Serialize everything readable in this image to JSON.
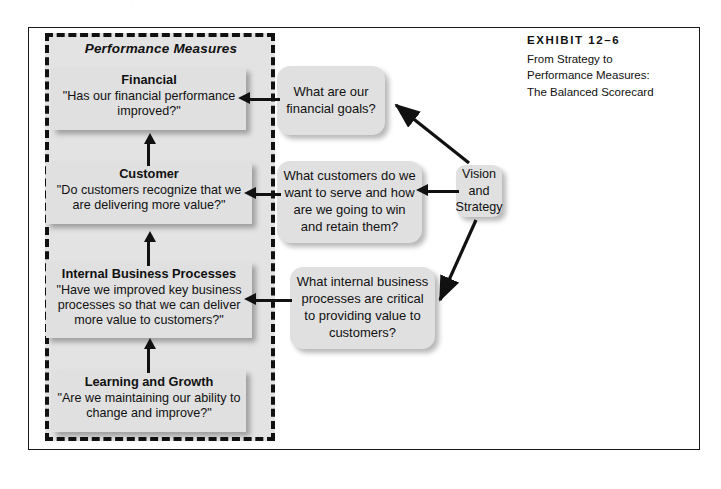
{
  "page": {
    "ghost_text": "· · ·",
    "background_color": "#ffffff"
  },
  "exhibit": {
    "number_label": "EXHIBIT 12–6",
    "caption_lines": [
      "From Strategy to",
      "Performance Measures:",
      "The Balanced Scorecard"
    ]
  },
  "diagram": {
    "region_title": "Performance Measures",
    "colors": {
      "box_fill": "#e0e0e0",
      "region_fill": "#e3e3e3",
      "line": "#111111",
      "frame": "#1a1a1a"
    },
    "measures": [
      {
        "id": "financial",
        "heading": "Financial",
        "question": "\"Has our financial performance improved?\""
      },
      {
        "id": "customer",
        "heading": "Customer",
        "question": "\"Do customers recognize that we are delivering more value?\""
      },
      {
        "id": "internal",
        "heading": "Internal Business Processes",
        "question": "\"Have we improved key business processes so that we can deliver more value to customers?\""
      },
      {
        "id": "learning",
        "heading": "Learning and Growth",
        "question": "\"Are we maintaining our ability to change and improve?\""
      }
    ],
    "questions": [
      {
        "id": "financial-goals",
        "text": "What are our financial goals?"
      },
      {
        "id": "customers-serve",
        "text": "What customers do we want to serve and how are we going to win and retain them?"
      },
      {
        "id": "internal-processes",
        "text": "What internal business processes are critical to providing value to customers?"
      }
    ],
    "vision": {
      "text": "Vision and Strategy"
    }
  }
}
